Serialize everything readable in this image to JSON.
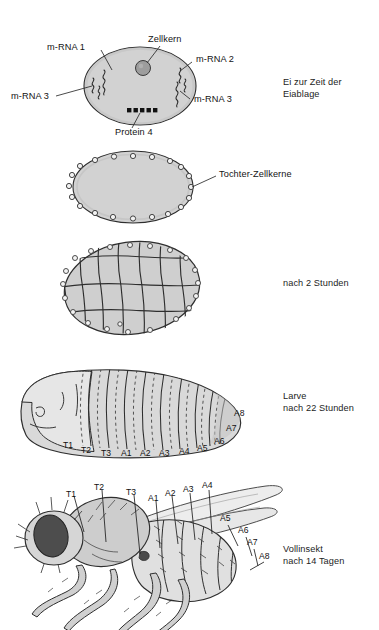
{
  "figure": {
    "background_color": "#ffffff",
    "line_color": "#2b2b2b",
    "egg_fill": "#d2d2d2",
    "egg_fill_dark": "#c2c2c2",
    "nucleus_fill": "#9b9b9b",
    "protein_color": "#111111",
    "body_fill": "#d8d8d8",
    "eye_fill": "#4a4a4a"
  },
  "stages": [
    {
      "id": "egg-at-laying",
      "caption_line1": "Ei zur Zeit der",
      "caption_line2": "Eiablage",
      "labels": [
        {
          "name": "m-rna-1",
          "text": "m-RNA 1"
        },
        {
          "name": "zellkern",
          "text": "Zellkern"
        },
        {
          "name": "m-rna-2",
          "text": "m-RNA 2"
        },
        {
          "name": "m-rna-3-left",
          "text": "m-RNA 3"
        },
        {
          "name": "m-rna-3-right",
          "text": "m-RNA 3"
        },
        {
          "name": "protein-4",
          "text": "Protein 4"
        }
      ]
    },
    {
      "id": "syncytial-blastoderm",
      "caption_line1": "",
      "caption_line2": "",
      "labels": [
        {
          "name": "tochter-zellkerne",
          "text": "Tochter-Zellkerne"
        }
      ]
    },
    {
      "id": "cellular-blastoderm",
      "caption_line1": "nach 2 Stunden",
      "caption_line2": "",
      "labels": []
    },
    {
      "id": "larva",
      "caption_line1": "Larve",
      "caption_line2": "nach 22 Stunden",
      "labels": []
    },
    {
      "id": "adult-fly",
      "caption_line1": "Vollinsekt",
      "caption_line2": "nach 14 Tagen",
      "labels": []
    }
  ],
  "larva_segments": [
    {
      "id": "T1",
      "text": "T1",
      "x": 63,
      "y": 443
    },
    {
      "id": "T2",
      "text": "T2",
      "x": 81,
      "y": 448
    },
    {
      "id": "T3",
      "text": "T3",
      "x": 101,
      "y": 450
    },
    {
      "id": "A1",
      "text": "A1",
      "x": 121,
      "y": 450
    },
    {
      "id": "A2",
      "text": "A2",
      "x": 140,
      "y": 450
    },
    {
      "id": "A3",
      "text": "A3",
      "x": 160,
      "y": 450
    },
    {
      "id": "A4",
      "text": "A4",
      "x": 180,
      "y": 448
    },
    {
      "id": "A5",
      "text": "A5",
      "x": 198,
      "y": 445
    },
    {
      "id": "A6",
      "text": "A6",
      "x": 216,
      "y": 438
    },
    {
      "id": "A7",
      "text": "A7",
      "x": 228,
      "y": 425
    },
    {
      "id": "A8",
      "text": "A8",
      "x": 236,
      "y": 410
    }
  ],
  "adult_segments": [
    {
      "id": "T1",
      "text": "T1",
      "x": 68,
      "y": 489
    },
    {
      "id": "T2",
      "text": "T2",
      "x": 96,
      "y": 482
    },
    {
      "id": "T3",
      "text": "T3",
      "x": 128,
      "y": 487
    },
    {
      "id": "A1",
      "text": "A1",
      "x": 150,
      "y": 492
    },
    {
      "id": "A2",
      "text": "A2",
      "x": 166,
      "y": 488
    },
    {
      "id": "A3",
      "text": "A3",
      "x": 184,
      "y": 485
    },
    {
      "id": "A4",
      "text": "A4",
      "x": 203,
      "y": 482
    },
    {
      "id": "A5",
      "text": "A5",
      "x": 221,
      "y": 513
    },
    {
      "id": "A6",
      "text": "A6",
      "x": 239,
      "y": 525
    },
    {
      "id": "A7",
      "text": "A7",
      "x": 248,
      "y": 537
    },
    {
      "id": "A8",
      "text": "A8",
      "x": 259,
      "y": 551
    }
  ]
}
